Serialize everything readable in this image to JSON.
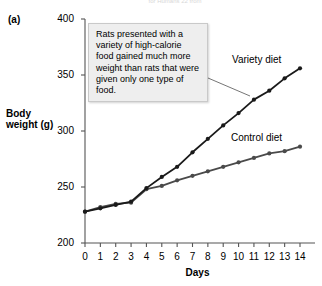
{
  "panel": {
    "label": "(a)"
  },
  "top_caption": {
    "text": "for Humans 22 from"
  },
  "callout": {
    "text": "Rats presented with a variety of high-calorie food gained much more weight than rats that were given only one type of food."
  },
  "labels": {
    "variety": "Variety diet",
    "control": "Control diet"
  },
  "chart_data": {
    "type": "line",
    "title": "",
    "xlabel": "Days",
    "ylabel": "Body weight (g)",
    "xlim": [
      0,
      14
    ],
    "ylim": [
      200,
      400
    ],
    "yticks": [
      200,
      250,
      300,
      350,
      400
    ],
    "xticks": [
      0,
      1,
      2,
      3,
      4,
      5,
      6,
      7,
      8,
      9,
      10,
      11,
      12,
      13,
      14
    ],
    "grid": false,
    "legend": "inline-annotations",
    "x": [
      0,
      1,
      2,
      3,
      4,
      5,
      6,
      7,
      8,
      9,
      10,
      11,
      12,
      13,
      14
    ],
    "series": [
      {
        "name": "Variety diet",
        "color": "#1a1a1a",
        "marker": "circle",
        "values": [
          228,
          231,
          234,
          237,
          249,
          259,
          268,
          281,
          293,
          305,
          316,
          328,
          336,
          347,
          356
        ]
      },
      {
        "name": "Control diet",
        "color": "#4a4a4a",
        "marker": "circle",
        "values": [
          228,
          232,
          235,
          236,
          248,
          251,
          256,
          260,
          264,
          268,
          272,
          276,
          280,
          282,
          286
        ]
      }
    ]
  },
  "colors": {
    "axis": "#555555",
    "variety": "#1a1a1a",
    "control": "#4a4a4a",
    "callout_bg": "#eeeeee",
    "callout_border": "#c9c9c9"
  }
}
